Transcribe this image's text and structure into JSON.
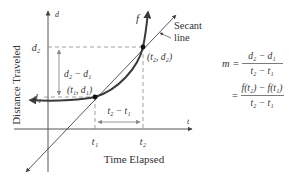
{
  "figure": {
    "axes": {
      "x_axis_label": "Time Elapsed",
      "y_axis_label": "Distance Traveled",
      "x_var": "t",
      "y_var": "d"
    },
    "curve": {
      "label": "f"
    },
    "secant": {
      "label_line1": "Secant",
      "label_line2": "line"
    },
    "points": {
      "p1": "(t₁, d₁)",
      "p2": "(t₂, d₂)"
    },
    "ticks": {
      "t1": "t₁",
      "t2": "t₂",
      "d1": "d₁",
      "d2": "d₂"
    },
    "brackets": {
      "rise": "d₂ − d₁",
      "run": "t₂ − t₁"
    },
    "formula": {
      "lhs": "m =",
      "num1": "d₂ − d₁",
      "den1": "t₂ − t₁",
      "eq2": "=",
      "num2": "f(t₂) − f(t₁)",
      "den2": "t₂ − t₁"
    },
    "colors": {
      "curve": "#3a3a3a",
      "axis": "#555555",
      "dashed": "#888888",
      "text": "#333333"
    }
  }
}
